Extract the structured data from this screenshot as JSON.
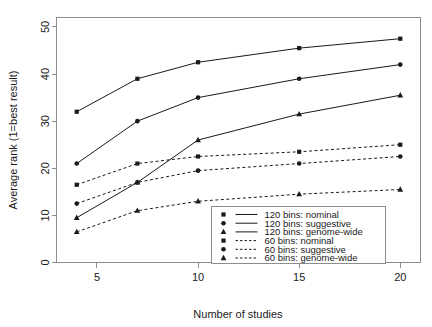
{
  "chart_data": {
    "type": "line",
    "title": "",
    "xlabel": "Number of studies",
    "ylabel": "Average rank (1=best result)",
    "x": [
      4,
      7,
      10,
      15,
      20
    ],
    "xlim": [
      3,
      21
    ],
    "ylim": [
      0,
      52
    ],
    "xticks": [
      5,
      10,
      15,
      20
    ],
    "xtick_labels": [
      "5",
      "10",
      "15",
      "20"
    ],
    "yticks": [
      0,
      10,
      20,
      30,
      40,
      50
    ],
    "ytick_labels": [
      "0",
      "10",
      "20",
      "30",
      "40",
      "50"
    ],
    "grid": false,
    "legend_position": "bottom-right",
    "series": [
      {
        "name": "120 bins: nominal",
        "marker": "square",
        "linestyle": "solid",
        "color": "#1a1a1a",
        "values": [
          32,
          39,
          42.5,
          45.5,
          47.5
        ]
      },
      {
        "name": "120 bins: suggestive",
        "marker": "circle",
        "linestyle": "solid",
        "color": "#1a1a1a",
        "values": [
          21,
          30,
          35,
          39,
          42
        ]
      },
      {
        "name": "120 bins: genome-wide",
        "marker": "triangle",
        "linestyle": "solid",
        "color": "#1a1a1a",
        "values": [
          9.5,
          17,
          26,
          31.5,
          35.5
        ]
      },
      {
        "name": "60 bins: nominal",
        "marker": "square",
        "linestyle": "dashed",
        "color": "#1a1a1a",
        "values": [
          16.5,
          21,
          22.5,
          23.5,
          25
        ]
      },
      {
        "name": "60 bins: suggestive",
        "marker": "circle",
        "linestyle": "dashed",
        "color": "#1a1a1a",
        "values": [
          12.5,
          17,
          19.5,
          21,
          22.5
        ]
      },
      {
        "name": "60 bins: genome-wide",
        "marker": "triangle",
        "linestyle": "dashed",
        "color": "#1a1a1a",
        "values": [
          6.5,
          11,
          13,
          14.5,
          15.5
        ]
      }
    ],
    "legend_entries": [
      {
        "label": "120 bins: nominal",
        "marker": "square",
        "linestyle": "solid"
      },
      {
        "label": "120 bins: suggestive",
        "marker": "circle",
        "linestyle": "solid"
      },
      {
        "label": "120 bins: genome-wide",
        "marker": "triangle",
        "linestyle": "solid"
      },
      {
        "label": "60 bins: nominal",
        "marker": "square",
        "linestyle": "dashed"
      },
      {
        "label": "60 bins: suggestive",
        "marker": "circle",
        "linestyle": "dashed"
      },
      {
        "label": "60 bins: genome-wide",
        "marker": "triangle",
        "linestyle": "dashed"
      }
    ]
  }
}
